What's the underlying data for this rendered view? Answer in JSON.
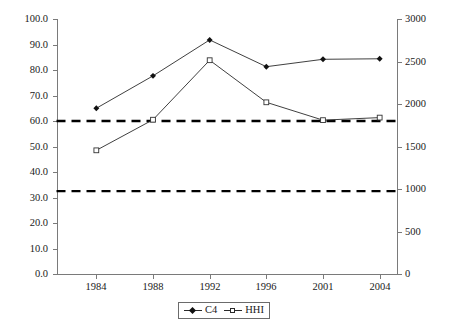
{
  "chart_data": {
    "type": "line",
    "title": "",
    "subtitle": "",
    "xlabel": "",
    "ylabel": "",
    "y2label": "",
    "categories": [
      "1984",
      "1988",
      "1992",
      "1996",
      "2001",
      "2004"
    ],
    "grid": false,
    "legend_position": "bottom-center",
    "axes": {
      "left": {
        "min": 0.0,
        "max": 100.0,
        "step": 10.0,
        "ticks": [
          "0.0",
          "10.0",
          "20.0",
          "30.0",
          "40.0",
          "50.0",
          "60.0",
          "70.0",
          "80.0",
          "90.0",
          "100.0"
        ]
      },
      "right": {
        "min": 0,
        "max": 3000,
        "step": 500,
        "ticks": [
          "0",
          "500",
          "1000",
          "1500",
          "2000",
          "2500",
          "3000"
        ]
      },
      "x": {
        "ticks": [
          "1984",
          "1988",
          "1992",
          "1996",
          "2001",
          "2004"
        ]
      }
    },
    "series": [
      {
        "name": "C4",
        "axis": "left",
        "marker": "filled-diamond",
        "values": [
          65.0,
          77.7,
          91.8,
          81.3,
          84.2,
          84.4
        ]
      },
      {
        "name": "HHI",
        "axis": "right",
        "marker": "open-square",
        "values": [
          1455,
          1815,
          2515,
          2020,
          1810,
          1840
        ]
      }
    ],
    "reference_lines": [
      {
        "name": "upper-threshold",
        "left_value": 60.0,
        "right_value": 1800,
        "style": "dashed"
      },
      {
        "name": "lower-threshold",
        "left_value": 32.5,
        "right_value": 1000,
        "style": "dashed"
      }
    ],
    "colors": {
      "series_c4": "#2a2a2a",
      "series_hhi": "#2a2a2a",
      "reference_line": "#000000",
      "axis": "#7a7a7a",
      "background": "#ffffff"
    }
  },
  "legend": {
    "items": [
      {
        "label": "C4",
        "icon": "filled-diamond-marker-icon"
      },
      {
        "label": "HHI",
        "icon": "open-square-marker-icon"
      }
    ]
  }
}
